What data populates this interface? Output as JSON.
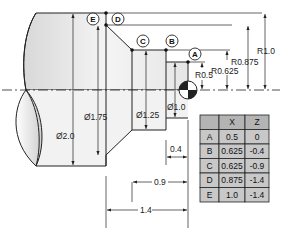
{
  "points": [
    {
      "id": "A",
      "x": "0.5",
      "z": "0"
    },
    {
      "id": "B",
      "x": "0.625",
      "z": "-0.4"
    },
    {
      "id": "C",
      "x": "0.625",
      "z": "-0.9"
    },
    {
      "id": "D",
      "x": "0.875",
      "z": "-1.4"
    },
    {
      "id": "E",
      "x": "1.0",
      "z": "-1.4"
    }
  ],
  "table": {
    "headers": [
      "",
      "X",
      "Z"
    ]
  },
  "dimensions": {
    "dia_2_0": "Ø2.0",
    "dia_1_75": "Ø1.75",
    "dia_1_25": "Ø1.25",
    "dia_1_0": "Ø1.0",
    "r_1_0": "R1.0",
    "r_0_875": "R0.875",
    "r_0_625": "R0.625",
    "r_0_5": "R0.5",
    "len_0_4": "0.4",
    "len_0_9": "0.9",
    "len_1_4": "1.4"
  },
  "colors": {
    "line": "#222222",
    "part_fill_light": "#f4f4f4",
    "part_fill_dark": "#d6d6d6",
    "table_fill": "#c8c8c8",
    "table_header": "#b4b4b4"
  }
}
